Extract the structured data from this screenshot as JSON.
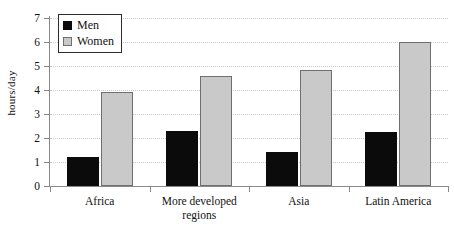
{
  "chart_data": {
    "type": "bar",
    "title": "",
    "xlabel": "",
    "ylabel": "hours/day",
    "ylim": [
      0,
      7
    ],
    "ytick_labels": [
      "0",
      "1",
      "2",
      "3",
      "4",
      "5",
      "6",
      "7"
    ],
    "grid": true,
    "legend_position": "top-left",
    "categories": [
      "Africa",
      "More developed regions",
      "Asia",
      "Latin America"
    ],
    "series": [
      {
        "name": "Men",
        "color": "#0b0b0b",
        "values": [
          1.2,
          2.3,
          1.4,
          2.25
        ]
      },
      {
        "name": "Women",
        "color": "#c9c9c9",
        "values": [
          3.9,
          4.6,
          4.85,
          6.0
        ]
      }
    ]
  },
  "legend": {
    "items": [
      {
        "label": "Men",
        "swatch": "black-square-icon"
      },
      {
        "label": "Women",
        "swatch": "gray-square-icon"
      }
    ]
  },
  "axis": {
    "y_title": "hours/day"
  }
}
